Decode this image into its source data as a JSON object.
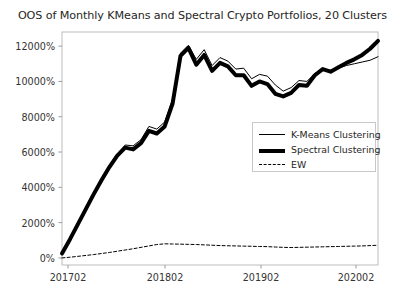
{
  "chart_data": {
    "type": "line",
    "title": "OOS of Monthly KMeans and Spectral Crypto Portfolios, 20 Clusters",
    "xlabel": "",
    "ylabel": "",
    "grid": false,
    "legend_position": "center-right",
    "xtick_labels": [
      "201702",
      "201802",
      "201902",
      "202002"
    ],
    "xtick_values": [
      201702,
      201802,
      201902,
      202002
    ],
    "ytick_labels": [
      "0%",
      "2000%",
      "4000%",
      "6000%",
      "8000%",
      "10000%",
      "12000%"
    ],
    "ytick_values": [
      0,
      2000,
      4000,
      6000,
      8000,
      10000,
      12000
    ],
    "ylim": [
      -400,
      12800
    ],
    "xlim": [
      0,
      40
    ],
    "x": [
      0,
      1,
      2,
      3,
      4,
      5,
      6,
      7,
      8,
      9,
      10,
      11,
      12,
      13,
      14,
      15,
      16,
      17,
      18,
      19,
      20,
      21,
      22,
      23,
      24,
      25,
      26,
      27,
      28,
      29,
      30,
      31,
      32,
      33,
      34,
      35,
      36,
      37,
      38,
      39,
      40
    ],
    "series": [
      {
        "name": "K-Means Clustering",
        "style": "solid-thin",
        "color": "#000000",
        "linewidth": 1,
        "values": [
          300,
          1150,
          2000,
          2850,
          3700,
          4500,
          5250,
          5900,
          6400,
          6350,
          6700,
          7450,
          7300,
          7700,
          9000,
          11600,
          12050,
          11250,
          11800,
          10900,
          11350,
          11150,
          10700,
          10750,
          10150,
          10400,
          10300,
          9800,
          9450,
          9650,
          10050,
          10000,
          10450,
          10700,
          10600,
          10750,
          10900,
          11000,
          11100,
          11200,
          11400
        ]
      },
      {
        "name": "Spectral Clustering",
        "style": "solid-thick",
        "color": "#000000",
        "linewidth": 4,
        "values": [
          250,
          1050,
          1900,
          2750,
          3600,
          4400,
          5150,
          5800,
          6250,
          6150,
          6500,
          7200,
          7050,
          7450,
          8750,
          11450,
          11900,
          10950,
          11500,
          10600,
          11050,
          10850,
          10350,
          10350,
          9750,
          10000,
          9850,
          9300,
          9150,
          9350,
          9800,
          9750,
          10350,
          10700,
          10550,
          10800,
          11050,
          11250,
          11500,
          11850,
          12300
        ]
      },
      {
        "name": "EW",
        "style": "dashed",
        "color": "#000000",
        "linewidth": 1,
        "values": [
          0,
          40,
          90,
          140,
          190,
          250,
          310,
          380,
          450,
          520,
          600,
          680,
          760,
          800,
          790,
          780,
          770,
          760,
          740,
          720,
          700,
          690,
          680,
          670,
          660,
          650,
          640,
          620,
          600,
          590,
          600,
          610,
          620,
          630,
          640,
          650,
          660,
          670,
          680,
          700,
          720
        ]
      }
    ]
  },
  "legend": {
    "entries": [
      {
        "label": "K-Means Clustering",
        "sample": "thin-line-icon"
      },
      {
        "label": "Spectral Clustering",
        "sample": "thick-line-icon"
      },
      {
        "label": "EW",
        "sample": "dashed-line-icon"
      }
    ]
  }
}
